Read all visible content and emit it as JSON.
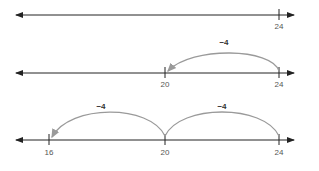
{
  "diagram": {
    "lines": [
      {
        "ticks": [
          {
            "value": "24"
          }
        ],
        "jumps": []
      },
      {
        "ticks": [
          {
            "value": "20"
          },
          {
            "value": "24"
          }
        ],
        "jumps": [
          {
            "label": "−4",
            "from": "24",
            "to": "20"
          }
        ]
      },
      {
        "ticks": [
          {
            "value": "16"
          },
          {
            "value": "20"
          },
          {
            "value": "24"
          }
        ],
        "jumps": [
          {
            "label": "−4",
            "from": "20",
            "to": "16"
          },
          {
            "label": "−4",
            "from": "24",
            "to": "20"
          }
        ]
      }
    ],
    "colors": {
      "axis": "#222222",
      "arc": "#9a9a9a",
      "label": "#555555"
    }
  }
}
